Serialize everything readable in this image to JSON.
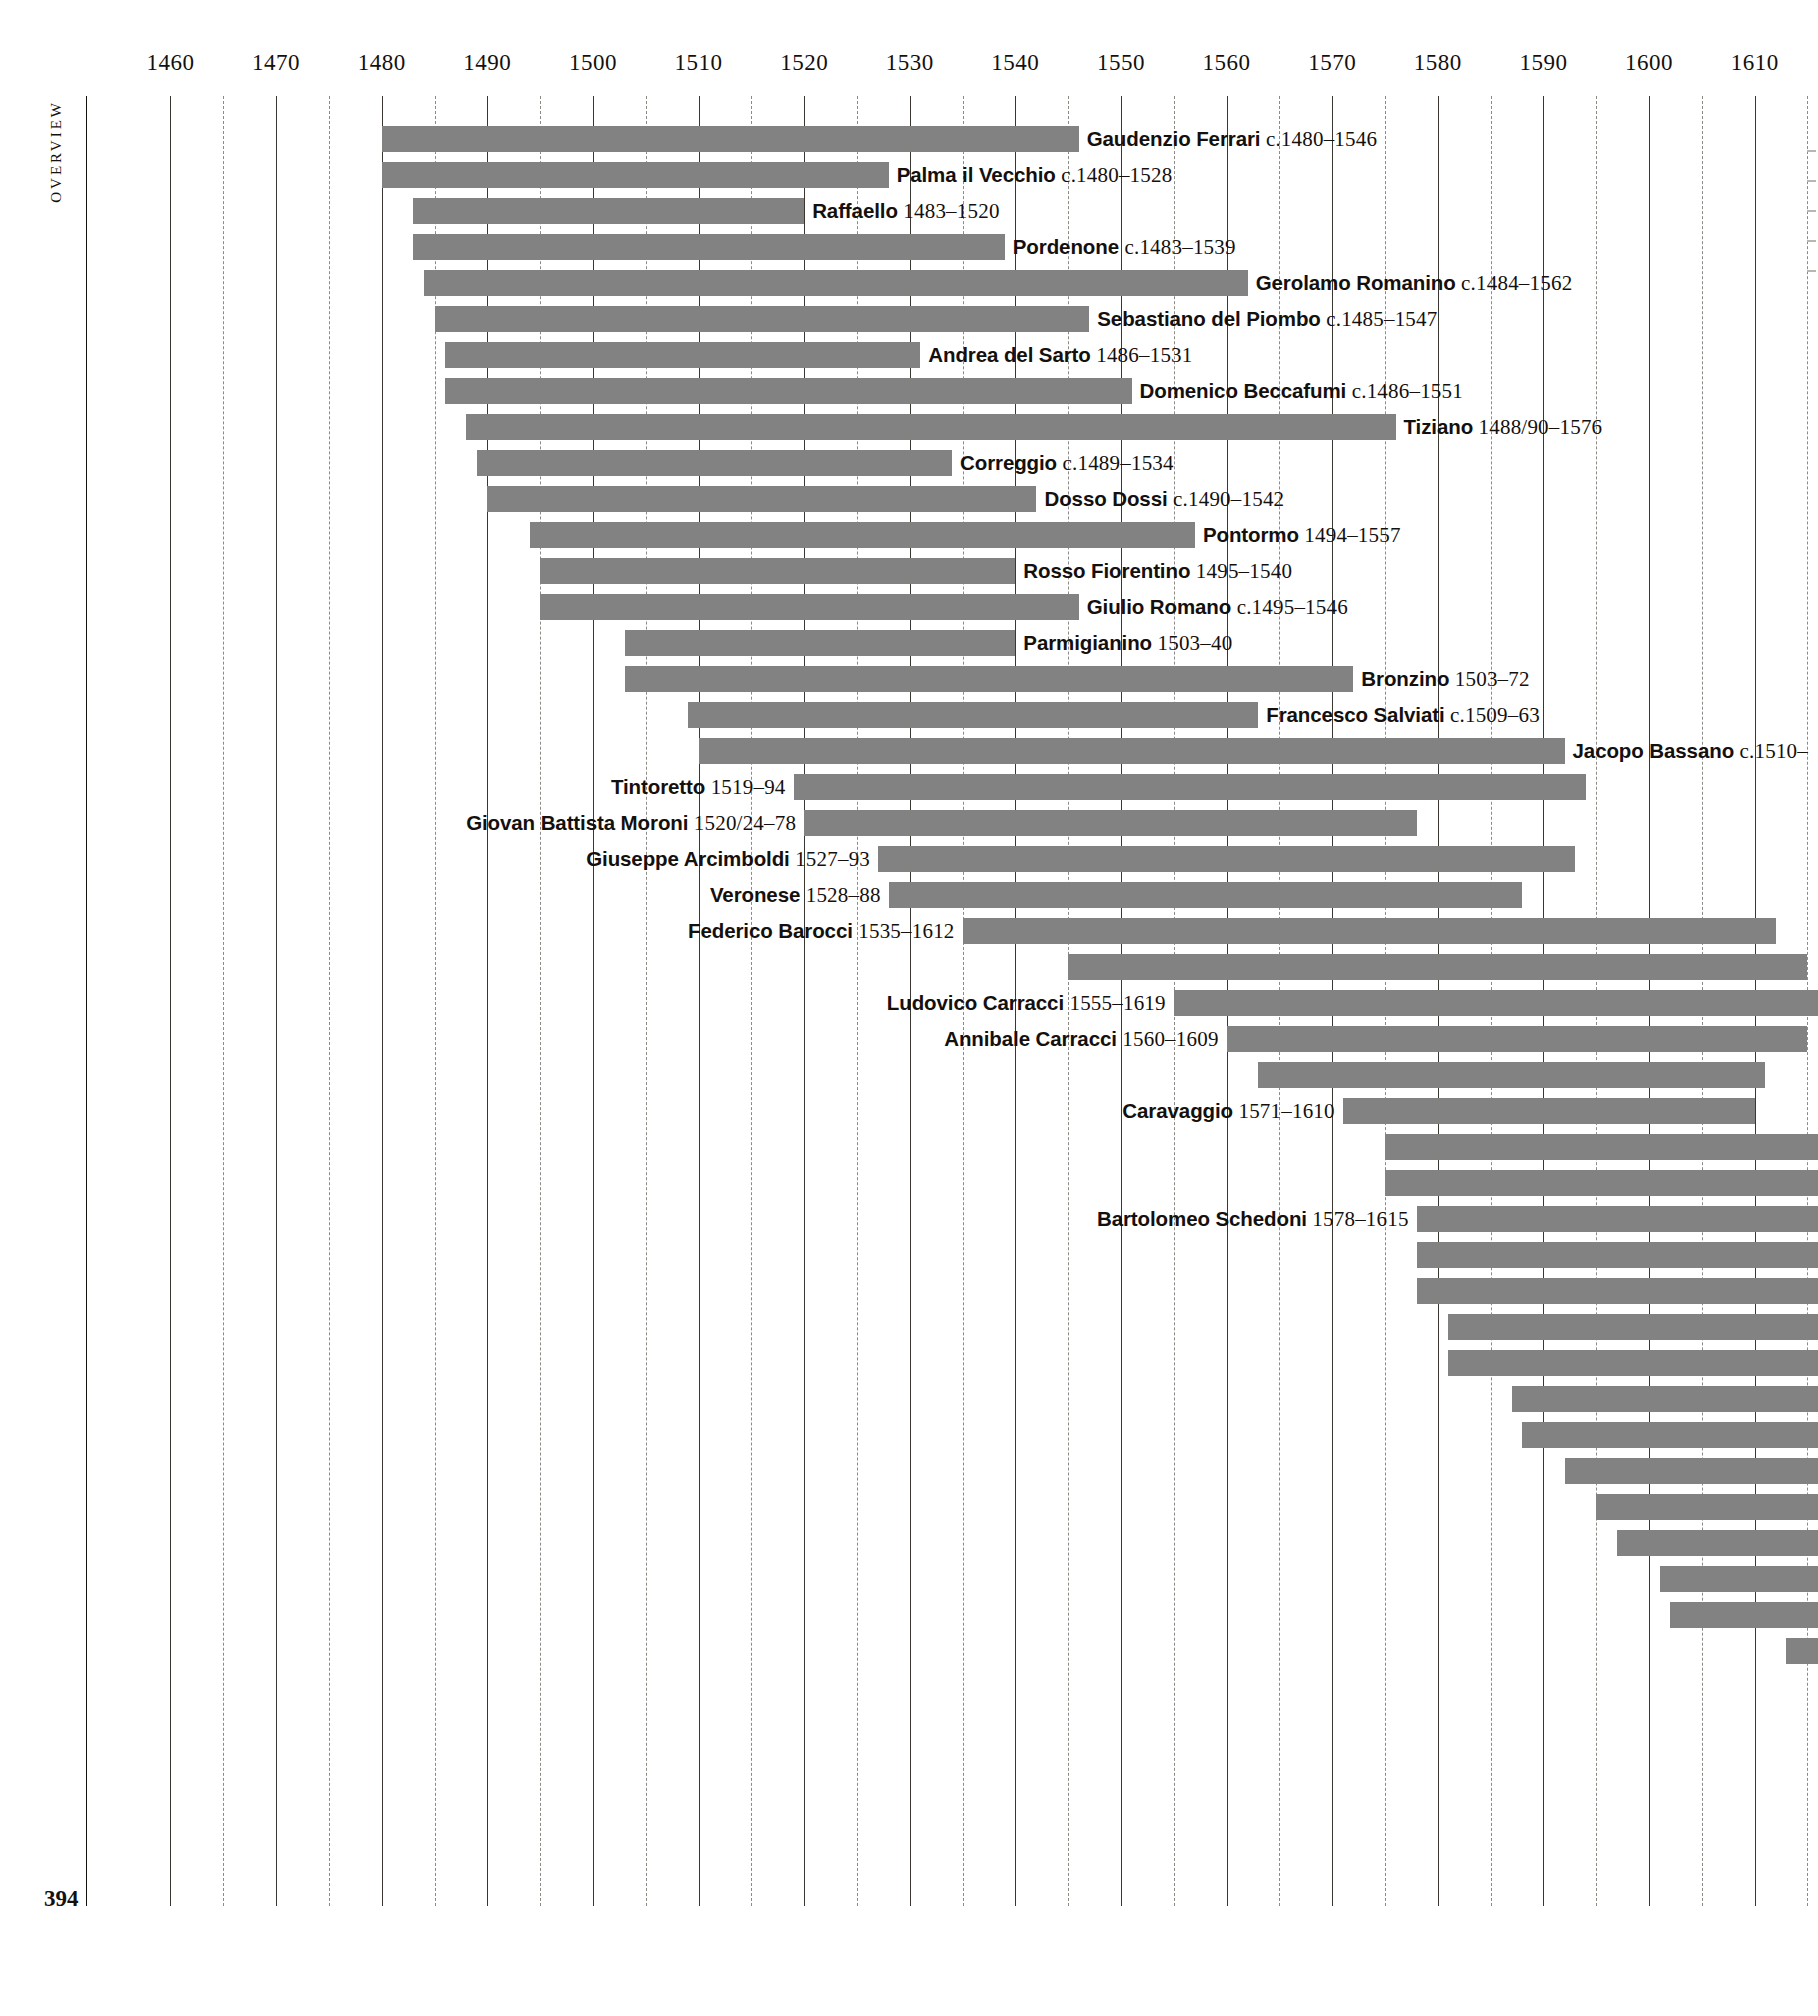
{
  "page": {
    "running_head": "Overview",
    "page_number": "394"
  },
  "chart_data": {
    "type": "bar",
    "orientation": "horizontal",
    "title": "Overview",
    "xlabel": "",
    "ylabel": "",
    "xlim": [
      1452,
      1616
    ],
    "grid": true,
    "legend": false,
    "axis": {
      "major_ticks": [
        1460,
        1470,
        1480,
        1490,
        1500,
        1510,
        1520,
        1530,
        1540,
        1550,
        1560,
        1570,
        1580,
        1590,
        1600,
        1610
      ],
      "minor_ticks": [
        1465,
        1475,
        1485,
        1495,
        1505,
        1515,
        1525,
        1535,
        1545,
        1555,
        1565,
        1575,
        1585,
        1595,
        1605,
        1615
      ],
      "tick_labels": [
        "1460",
        "1470",
        "1480",
        "1490",
        "1500",
        "1510",
        "1520",
        "1530",
        "1540",
        "1550",
        "1560",
        "1570",
        "1580",
        "1590",
        "1600",
        "1610"
      ]
    },
    "categories": [
      "Gaudenzio Ferrari",
      "Palma il Vecchio",
      "Raffaello",
      "Pordenone",
      "Gerolamo Romanino",
      "Sebastiano del Piombo",
      "Andrea del Sarto",
      "Domenico Beccafumi",
      "Tiziano",
      "Correggio",
      "Dosso Dossi",
      "Pontormo",
      "Rosso Fiorentino",
      "Giulio Romano",
      "Parmigianino",
      "Bronzino",
      "Francesco Salviati",
      "Jacopo Bassano",
      "Tintoretto",
      "Giovan Battista Moroni",
      "Giuseppe Arcimboldi",
      "Veronese",
      "Federico Barocci",
      "",
      "Ludovico Carracci",
      "Annibale Carracci",
      "",
      "Caravaggio",
      "",
      "",
      "Bartolomeo Schedoni",
      "",
      "",
      "",
      "",
      "",
      "",
      "",
      "",
      "",
      "",
      ""
    ],
    "rows": [
      {
        "name": "Gaudenzio Ferrari",
        "dates": "c.1480–1546",
        "start": 1480,
        "end": 1546,
        "label_side": "right"
      },
      {
        "name": "Palma il Vecchio",
        "dates": "c.1480–1528",
        "start": 1480,
        "end": 1528,
        "label_side": "right"
      },
      {
        "name": "Raffaello",
        "dates": "1483–1520",
        "start": 1483,
        "end": 1520,
        "label_side": "right"
      },
      {
        "name": "Pordenone",
        "dates": "c.1483–1539",
        "start": 1483,
        "end": 1539,
        "label_side": "right"
      },
      {
        "name": "Gerolamo Romanino",
        "dates": "c.1484–1562",
        "start": 1484,
        "end": 1562,
        "label_side": "right"
      },
      {
        "name": "Sebastiano del Piombo",
        "dates": "c.1485–1547",
        "start": 1485,
        "end": 1547,
        "label_side": "right"
      },
      {
        "name": "Andrea del Sarto",
        "dates": "1486–1531",
        "start": 1486,
        "end": 1531,
        "label_side": "right"
      },
      {
        "name": "Domenico Beccafumi",
        "dates": "c.1486–1551",
        "start": 1486,
        "end": 1551,
        "label_side": "right"
      },
      {
        "name": "Tiziano",
        "dates": "1488/90–1576",
        "start": 1488,
        "end": 1576,
        "label_side": "right"
      },
      {
        "name": "Correggio",
        "dates": "c.1489–1534",
        "start": 1489,
        "end": 1534,
        "label_side": "right"
      },
      {
        "name": "Dosso Dossi",
        "dates": "c.1490–1542",
        "start": 1490,
        "end": 1542,
        "label_side": "right"
      },
      {
        "name": "Pontormo",
        "dates": "1494–1557",
        "start": 1494,
        "end": 1557,
        "label_side": "right"
      },
      {
        "name": "Rosso Fiorentino",
        "dates": "1495–1540",
        "start": 1495,
        "end": 1540,
        "label_side": "right"
      },
      {
        "name": "Giulio Romano",
        "dates": "c.1495–1546",
        "start": 1495,
        "end": 1546,
        "label_side": "right"
      },
      {
        "name": "Parmigianino",
        "dates": "1503–40",
        "start": 1503,
        "end": 1540,
        "label_side": "right"
      },
      {
        "name": "Bronzino",
        "dates": "1503–72",
        "start": 1503,
        "end": 1572,
        "label_side": "right"
      },
      {
        "name": "Francesco Salviati",
        "dates": "c.1509–63",
        "start": 1509,
        "end": 1563,
        "label_side": "right"
      },
      {
        "name": "Jacopo Bassano",
        "dates": "c.1510–",
        "start": 1510,
        "end": 1592,
        "label_side": "right"
      },
      {
        "name": "Tintoretto",
        "dates": "1519–94",
        "start": 1519,
        "end": 1594,
        "label_side": "left"
      },
      {
        "name": "Giovan Battista Moroni",
        "dates": "1520/24–78",
        "start": 1520,
        "end": 1578,
        "label_side": "left"
      },
      {
        "name": "Giuseppe Arcimboldi",
        "dates": "1527–93",
        "start": 1527,
        "end": 1593,
        "label_side": "left"
      },
      {
        "name": "Veronese",
        "dates": "1528–88",
        "start": 1528,
        "end": 1588,
        "label_side": "left"
      },
      {
        "name": "Federico Barocci",
        "dates": "1535–1612",
        "start": 1535,
        "end": 1612,
        "label_side": "left"
      },
      {
        "name": "",
        "dates": "",
        "start": 1545,
        "end": 1615,
        "label_side": "none"
      },
      {
        "name": "Ludovico Carracci",
        "dates": "1555–1619",
        "start": 1555,
        "end": 1616,
        "label_side": "left"
      },
      {
        "name": "Annibale Carracci",
        "dates": "1560–1609",
        "start": 1560,
        "end": 1615,
        "label_side": "left"
      },
      {
        "name": "",
        "dates": "",
        "start": 1563,
        "end": 1611,
        "label_side": "none"
      },
      {
        "name": "Caravaggio",
        "dates": "1571–1610",
        "start": 1571,
        "end": 1610,
        "label_side": "left"
      },
      {
        "name": "",
        "dates": "",
        "start": 1575,
        "end": 1616,
        "label_side": "none"
      },
      {
        "name": "",
        "dates": "",
        "start": 1575,
        "end": 1616,
        "label_side": "none"
      },
      {
        "name": "Bartolomeo Schedoni",
        "dates": "1578–1615",
        "start": 1578,
        "end": 1616,
        "label_side": "left"
      },
      {
        "name": "",
        "dates": "",
        "start": 1578,
        "end": 1616,
        "label_side": "none"
      },
      {
        "name": "",
        "dates": "",
        "start": 1578,
        "end": 1616,
        "label_side": "none"
      },
      {
        "name": "",
        "dates": "",
        "start": 1581,
        "end": 1616,
        "label_side": "none"
      },
      {
        "name": "",
        "dates": "",
        "start": 1581,
        "end": 1616,
        "label_side": "none"
      },
      {
        "name": "",
        "dates": "",
        "start": 1587,
        "end": 1616,
        "label_side": "none"
      },
      {
        "name": "",
        "dates": "",
        "start": 1588,
        "end": 1616,
        "label_side": "none"
      },
      {
        "name": "",
        "dates": "",
        "start": 1592,
        "end": 1616,
        "label_side": "none"
      },
      {
        "name": "",
        "dates": "",
        "start": 1595,
        "end": 1616,
        "label_side": "none"
      },
      {
        "name": "",
        "dates": "",
        "start": 1597,
        "end": 1616,
        "label_side": "none"
      },
      {
        "name": "",
        "dates": "",
        "start": 1601,
        "end": 1616,
        "label_side": "none"
      },
      {
        "name": "",
        "dates": "",
        "start": 1602,
        "end": 1616,
        "label_side": "none"
      },
      {
        "name": "",
        "dates": "",
        "start": 1613,
        "end": 1616,
        "label_side": "none"
      }
    ],
    "colors": {
      "bar": "#828282",
      "gridline_major": "#3a3632",
      "gridline_minor": "#8d8a86",
      "text": "#14100d",
      "background": "#ffffff"
    }
  }
}
